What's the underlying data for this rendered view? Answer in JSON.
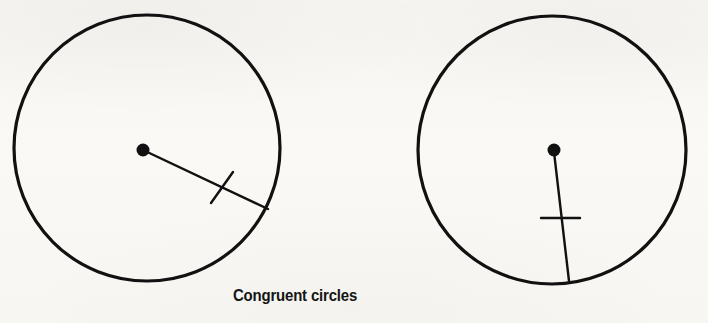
{
  "figure": {
    "caption": "Congruent circles",
    "background_color": "#f8f7f4",
    "ink_color": "#111111",
    "stroke_width_circle": 3.2,
    "stroke_width_radius": 2.4,
    "stroke_width_tick": 2.4,
    "left_circle": {
      "label": "left-circle",
      "center_x": 147,
      "center_y": 148,
      "radius": 133,
      "center_dot_x": 143,
      "center_dot_y": 150,
      "center_dot_radius": 6.5,
      "radius_line": {
        "x1": 143,
        "y1": 150,
        "x2": 268,
        "y2": 209
      },
      "tick_mark": {
        "x1": 211,
        "y1": 203,
        "x2": 233,
        "y2": 172
      }
    },
    "right_circle": {
      "label": "right-circle",
      "center_x": 552,
      "center_y": 150,
      "radius": 134,
      "center_dot_x": 554,
      "center_dot_y": 150,
      "center_dot_radius": 6.5,
      "radius_line": {
        "x1": 554,
        "y1": 152,
        "x2": 569,
        "y2": 281
      },
      "tick_mark": {
        "x1": 541,
        "y1": 218,
        "x2": 580,
        "y2": 218
      }
    }
  },
  "bleed_through": {
    "line_1": "",
    "line_2": "",
    "line_3": ""
  }
}
